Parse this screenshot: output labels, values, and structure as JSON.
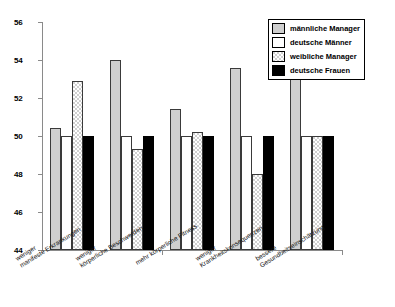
{
  "chart_data": {
    "type": "bar",
    "title": "",
    "xlabel": "",
    "ylabel": "",
    "ylim": [
      44,
      56
    ],
    "yticks": [
      44,
      46,
      48,
      50,
      52,
      54,
      56
    ],
    "grid": false,
    "legend_position": "top-right",
    "categories": [
      "weniger manifeste Erkrankungen",
      "weniger körperliche Beschwerden",
      "mehr körperliche Fitness",
      "weniger Krankheitskonsequenzen",
      "bessere Gesundheitseinschätzung"
    ],
    "categories_lines": [
      [
        "weniger",
        "manifeste Erkrankungen"
      ],
      [
        "weniger",
        "körperliche Beschwerden"
      ],
      [
        "mehr körperliche Fitness",
        ""
      ],
      [
        "weniger",
        "Krankheitskonsequenzen"
      ],
      [
        "bessere",
        "Gesundheitseinschätzung"
      ]
    ],
    "series": [
      {
        "name": "männliche Manager",
        "color": "#cfcfcf",
        "values": [
          50.4,
          54.0,
          51.4,
          53.6,
          55.3
        ]
      },
      {
        "name": "deutsche Männer",
        "color": "#ffffff",
        "values": [
          50.0,
          50.0,
          50.0,
          50.0,
          50.0
        ]
      },
      {
        "name": "weibliche Manager",
        "color": "#ffffff",
        "values": [
          52.9,
          49.3,
          50.2,
          48.0,
          50.0
        ]
      },
      {
        "name": "deutsche Frauen",
        "color": "#000000",
        "values": [
          50.0,
          50.0,
          50.0,
          50.0,
          50.0
        ]
      }
    ]
  },
  "legend": {
    "items": [
      {
        "label": "männliche Manager"
      },
      {
        "label": "deutsche Männer"
      },
      {
        "label": "weibliche Manager"
      },
      {
        "label": "deutsche Frauen"
      }
    ]
  },
  "axis": {
    "y_tick_labels": [
      "44",
      "46",
      "48",
      "50",
      "52",
      "54",
      "56"
    ]
  }
}
